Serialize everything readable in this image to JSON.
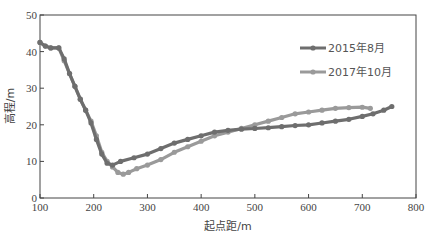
{
  "chart_data": {
    "type": "line",
    "title": "",
    "xlabel": "起点距/m",
    "ylabel": "高程/m",
    "xlim": [
      100,
      800
    ],
    "ylim": [
      0,
      50
    ],
    "xticks": [
      100,
      200,
      300,
      400,
      500,
      600,
      700,
      800
    ],
    "yticks": [
      0,
      10,
      20,
      30,
      40,
      50
    ],
    "grid": false,
    "legend_position": "upper right (inside)",
    "series": [
      {
        "name": "2015年8月",
        "color": "#6e6e6e",
        "marker": "circle",
        "x": [
          100,
          110,
          120,
          135,
          145,
          155,
          165,
          175,
          185,
          195,
          205,
          215,
          225,
          235,
          250,
          275,
          300,
          325,
          350,
          375,
          400,
          425,
          450,
          475,
          500,
          525,
          550,
          575,
          600,
          625,
          650,
          675,
          700,
          720,
          740,
          755
        ],
        "y": [
          42.5,
          41.5,
          41,
          41,
          38,
          34,
          30.5,
          27,
          24,
          20.5,
          16,
          12,
          9.5,
          9,
          10,
          11,
          12,
          13.5,
          15,
          16,
          17,
          18,
          18.5,
          18.8,
          19,
          19.2,
          19.5,
          19.8,
          20,
          20.5,
          21,
          21.5,
          22.3,
          23,
          24,
          25
        ]
      },
      {
        "name": "2017年10月",
        "color": "#9a9a9a",
        "marker": "circle",
        "x": [
          100,
          110,
          120,
          135,
          145,
          155,
          165,
          175,
          185,
          195,
          205,
          215,
          225,
          235,
          245,
          255,
          265,
          280,
          300,
          325,
          350,
          375,
          400,
          425,
          450,
          475,
          500,
          525,
          550,
          575,
          600,
          625,
          650,
          675,
          700,
          715
        ],
        "y": [
          42.5,
          41.5,
          41,
          41,
          37.5,
          34,
          30.5,
          27,
          24,
          21,
          17,
          12.5,
          10,
          8.5,
          7,
          6.5,
          7,
          8,
          9,
          10.5,
          12.5,
          14,
          15.5,
          17,
          18,
          19,
          20,
          21,
          22,
          23,
          23.5,
          24,
          24.5,
          24.7,
          24.8,
          24.5
        ]
      }
    ]
  }
}
